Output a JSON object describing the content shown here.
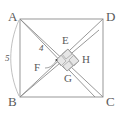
{
  "diagram": {
    "type": "geometry-figure",
    "colors": {
      "stroke": "#8c8c8c",
      "label": "#5a5a5a",
      "inner_fill": "#e6e6e6",
      "background": "#ffffff"
    },
    "outer_square": {
      "name": "ABCD",
      "vertices": [
        {
          "label": "A",
          "x": 20,
          "y": 19
        },
        {
          "label": "D",
          "x": 103,
          "y": 19
        },
        {
          "label": "C",
          "x": 103,
          "y": 97
        },
        {
          "label": "B",
          "x": 20,
          "y": 97
        }
      ]
    },
    "inner_square": {
      "name": "FEHG",
      "vertices": [
        {
          "label": "E",
          "x": 68,
          "y": 49
        },
        {
          "label": "H",
          "x": 79,
          "y": 61
        },
        {
          "label": "G",
          "x": 67,
          "y": 71
        },
        {
          "label": "F",
          "x": 56,
          "y": 60
        }
      ]
    },
    "right_angle_marks": 4,
    "measurements": [
      {
        "label": "4",
        "segment": "AF",
        "style": "straight"
      },
      {
        "label": "5",
        "segment": "AB",
        "style": "arc"
      }
    ],
    "labels": {
      "A": "A",
      "B": "B",
      "C": "C",
      "D": "D",
      "E": "E",
      "F": "F",
      "G": "G",
      "H": "H",
      "four": "4",
      "five": "5"
    }
  }
}
